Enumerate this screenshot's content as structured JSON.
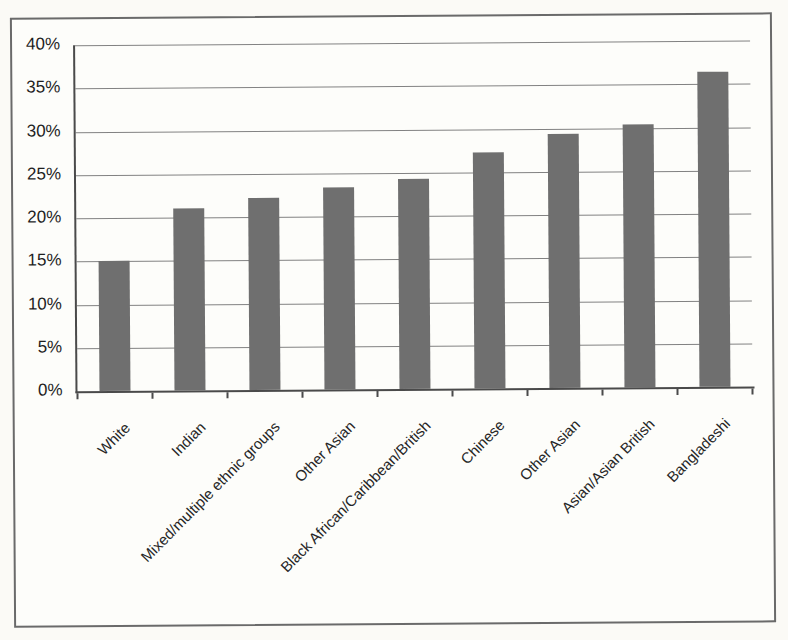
{
  "chart_data": {
    "type": "bar",
    "title": "",
    "xlabel": "",
    "ylabel": "",
    "categories": [
      "White",
      "Indian",
      "Mixed/multiple ethnic groups",
      "Other Asian",
      "Black African/Caribbean/British",
      "Chinese",
      "Other Asian",
      "Asian/Asian British",
      "Bangladeshi"
    ],
    "values": [
      15.0,
      21.0,
      22.2,
      23.3,
      24.3,
      27.3,
      29.4,
      30.4,
      36.4
    ],
    "ylim": [
      0,
      40
    ],
    "ytick_step": 5,
    "ytick_labels": [
      "40%",
      "35%",
      "30%",
      "25%",
      "20%",
      "15%",
      "10%",
      "5%",
      "0%"
    ],
    "grid": "horizontal",
    "legend": "none",
    "category_label_rotation_deg": 45
  },
  "colors": {
    "bar": "#6f6f6f",
    "gridline": "#828282",
    "axis": "#4a4a4a",
    "frame_border": "#6a6a6a",
    "page_background": "#fbfaf6",
    "figure_background": "#fdfdfa",
    "text": "#262626"
  }
}
